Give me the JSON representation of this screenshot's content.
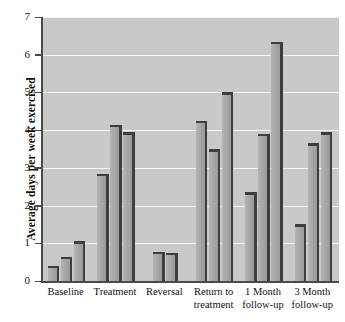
{
  "chart_data": {
    "type": "bar",
    "title": "",
    "subtitle": "",
    "xlabel": "",
    "ylabel": "Average days per week exercised",
    "ylim": [
      0,
      7
    ],
    "yticks": [
      0,
      1,
      2,
      3,
      4,
      5,
      6,
      7
    ],
    "ytick_labels": [
      "0",
      "1",
      "2",
      "3",
      "4",
      "5",
      "6",
      "7"
    ],
    "grid": true,
    "legend": "none",
    "categories": [
      "Baseline",
      "Treatment",
      "Reversal",
      "Return to treatment",
      "1 Month follow-up",
      "3 Month follow-up"
    ],
    "groups": [
      {
        "label": "Baseline",
        "label_lines": [
          "Baseline"
        ],
        "values": [
          0.4,
          0.65,
          1.05
        ]
      },
      {
        "label": "Treatment",
        "label_lines": [
          "Treatment"
        ],
        "values": [
          2.85,
          4.15,
          3.95
        ]
      },
      {
        "label": "Reversal",
        "label_lines": [
          "Reversal"
        ],
        "values": [
          0.78,
          0.75
        ]
      },
      {
        "label": "Return to treatment",
        "label_lines": [
          "Return to",
          "treatment"
        ],
        "values": [
          4.25,
          3.5,
          5.0
        ]
      },
      {
        "label": "1 Month follow-up",
        "label_lines": [
          "1 Month",
          "follow-up"
        ],
        "values": [
          2.35,
          3.9,
          6.35
        ]
      },
      {
        "label": "3 Month follow-up",
        "label_lines": [
          "3 Month",
          "follow-up"
        ],
        "values": [
          1.5,
          3.65,
          3.95
        ]
      }
    ],
    "series": [
      {
        "name": "bar-1",
        "values": [
          0.4,
          2.85,
          0.78,
          4.25,
          2.35,
          1.5
        ]
      },
      {
        "name": "bar-2",
        "values": [
          0.65,
          4.15,
          0.75,
          3.5,
          3.9,
          3.65
        ]
      },
      {
        "name": "bar-3",
        "values": [
          1.05,
          3.95,
          null,
          5.0,
          6.35,
          3.95
        ]
      }
    ],
    "colors": {
      "plot_background": "#c9c9c9",
      "gridline": "#f4f4f4",
      "bar_fill": "#a9a9a9",
      "bar_shadow": "#3e3e3e",
      "axis": "#4a4a4a",
      "text": "#111111",
      "page_background": "#ffffff"
    }
  }
}
